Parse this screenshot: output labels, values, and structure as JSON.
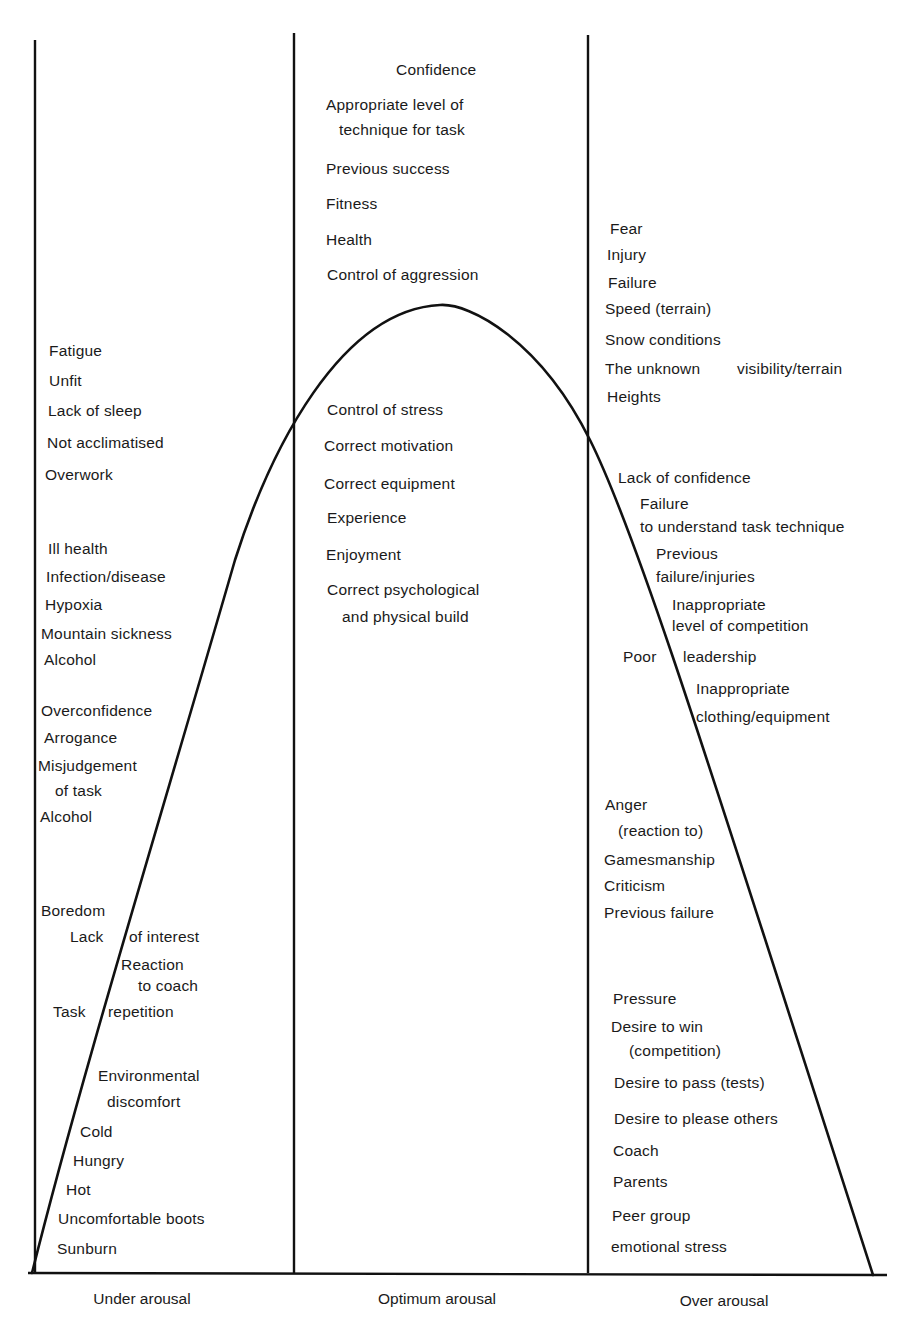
{
  "chart_data": {
    "type": "diagram",
    "title": "",
    "curve": "inverted-U (arousal vs performance)",
    "zones": [
      {
        "id": "under",
        "label": "Under arousal"
      },
      {
        "id": "optimum",
        "label": "Optimum arousal"
      },
      {
        "id": "over",
        "label": "Over arousal"
      }
    ]
  },
  "axis": {
    "under_label": "Under arousal",
    "optimum_label": "Optimum arousal",
    "over_label": "Over arousal"
  },
  "under": {
    "items": [
      {
        "text": "Fatigue",
        "x": 49,
        "y": 342
      },
      {
        "text": "Unfit",
        "x": 49,
        "y": 372
      },
      {
        "text": "Lack of sleep",
        "x": 48,
        "y": 402
      },
      {
        "text": "Not acclimatised",
        "x": 47,
        "y": 434
      },
      {
        "text": "Overwork",
        "x": 45,
        "y": 466
      },
      {
        "text": "Ill health",
        "x": 48,
        "y": 540
      },
      {
        "text": "Infection/disease",
        "x": 46,
        "y": 568
      },
      {
        "text": "Hypoxia",
        "x": 45,
        "y": 596
      },
      {
        "text": "Mountain sickness",
        "x": 41,
        "y": 625
      },
      {
        "text": "Alcohol",
        "x": 44,
        "y": 651
      },
      {
        "text": "Overconfidence",
        "x": 41,
        "y": 702
      },
      {
        "text": "Arrogance",
        "x": 44,
        "y": 729
      },
      {
        "text": "Misjudgement",
        "x": 38,
        "y": 757
      },
      {
        "text": "of task",
        "x": 55,
        "y": 782
      },
      {
        "text": "Alcohol",
        "x": 40,
        "y": 808
      },
      {
        "text": "Boredom",
        "x": 41,
        "y": 902
      },
      {
        "text": "Lack",
        "x": 70,
        "y": 928
      },
      {
        "text": "of interest",
        "x": 129,
        "y": 928
      },
      {
        "text": "Reaction",
        "x": 121,
        "y": 956
      },
      {
        "text": "to coach",
        "x": 138,
        "y": 977
      },
      {
        "text": "Task",
        "x": 53,
        "y": 1003
      },
      {
        "text": "repetition",
        "x": 108,
        "y": 1003
      },
      {
        "text": "Environmental",
        "x": 98,
        "y": 1067
      },
      {
        "text": "discomfort",
        "x": 107,
        "y": 1093
      },
      {
        "text": "Cold",
        "x": 80,
        "y": 1123
      },
      {
        "text": "Hungry",
        "x": 73,
        "y": 1152
      },
      {
        "text": "Hot",
        "x": 66,
        "y": 1181
      },
      {
        "text": "Uncomfortable boots",
        "x": 58,
        "y": 1210
      },
      {
        "text": "Sunburn",
        "x": 57,
        "y": 1240
      }
    ]
  },
  "optimum": {
    "items": [
      {
        "text": "Confidence",
        "x": 396,
        "y": 61
      },
      {
        "text": "Appropriate level of",
        "x": 326,
        "y": 96
      },
      {
        "text": "technique for task",
        "x": 339,
        "y": 121
      },
      {
        "text": "Previous success",
        "x": 326,
        "y": 160
      },
      {
        "text": "Fitness",
        "x": 326,
        "y": 195
      },
      {
        "text": "Health",
        "x": 326,
        "y": 231
      },
      {
        "text": "Control of aggression",
        "x": 327,
        "y": 266
      },
      {
        "text": "Control of stress",
        "x": 327,
        "y": 401
      },
      {
        "text": "Correct motivation",
        "x": 324,
        "y": 437
      },
      {
        "text": "Correct equipment",
        "x": 324,
        "y": 475
      },
      {
        "text": "Experience",
        "x": 327,
        "y": 509
      },
      {
        "text": "Enjoyment",
        "x": 326,
        "y": 546
      },
      {
        "text": "Correct psychological",
        "x": 327,
        "y": 581
      },
      {
        "text": "and physical build",
        "x": 342,
        "y": 608
      }
    ]
  },
  "over": {
    "items": [
      {
        "text": "Fear",
        "x": 610,
        "y": 220
      },
      {
        "text": "Injury",
        "x": 607,
        "y": 246
      },
      {
        "text": "Failure",
        "x": 608,
        "y": 274
      },
      {
        "text": "Speed (terrain)",
        "x": 605,
        "y": 300
      },
      {
        "text": "Snow conditions",
        "x": 605,
        "y": 331
      },
      {
        "text": "The unknown",
        "x": 605,
        "y": 360
      },
      {
        "text": "visibility/terrain",
        "x": 737,
        "y": 360
      },
      {
        "text": "Heights",
        "x": 607,
        "y": 388
      },
      {
        "text": "Lack of confidence",
        "x": 618,
        "y": 469
      },
      {
        "text": "Failure",
        "x": 640,
        "y": 495
      },
      {
        "text": "to understand task technique",
        "x": 640,
        "y": 518
      },
      {
        "text": "Previous",
        "x": 656,
        "y": 545
      },
      {
        "text": "failure/injuries",
        "x": 656,
        "y": 568
      },
      {
        "text": "Inappropriate",
        "x": 672,
        "y": 596
      },
      {
        "text": "level of competition",
        "x": 672,
        "y": 617
      },
      {
        "text": "Poor",
        "x": 623,
        "y": 648
      },
      {
        "text": "leadership",
        "x": 683,
        "y": 648
      },
      {
        "text": "Inappropriate",
        "x": 696,
        "y": 680
      },
      {
        "text": "clothing/equipment",
        "x": 696,
        "y": 708
      },
      {
        "text": "Anger",
        "x": 605,
        "y": 796
      },
      {
        "text": "(reaction to)",
        "x": 618,
        "y": 822
      },
      {
        "text": "Gamesmanship",
        "x": 604,
        "y": 851
      },
      {
        "text": "Criticism",
        "x": 604,
        "y": 877
      },
      {
        "text": "Previous failure",
        "x": 604,
        "y": 904
      },
      {
        "text": "Pressure",
        "x": 613,
        "y": 990
      },
      {
        "text": "Desire to win",
        "x": 611,
        "y": 1018
      },
      {
        "text": "(competition)",
        "x": 629,
        "y": 1042
      },
      {
        "text": "Desire to pass (tests)",
        "x": 614,
        "y": 1074
      },
      {
        "text": "Desire to please others",
        "x": 614,
        "y": 1110
      },
      {
        "text": "Coach",
        "x": 613,
        "y": 1142
      },
      {
        "text": "Parents",
        "x": 613,
        "y": 1173
      },
      {
        "text": "Peer group",
        "x": 612,
        "y": 1207
      },
      {
        "text": "emotional stress",
        "x": 611,
        "y": 1238
      }
    ]
  }
}
